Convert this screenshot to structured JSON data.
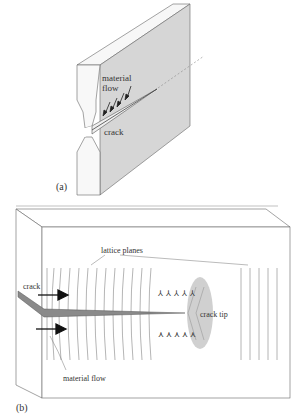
{
  "panel_a": {
    "label": "(a)",
    "annotations": {
      "material_flow_line1": "material",
      "material_flow_line2": "flow",
      "crack": "crack"
    }
  },
  "panel_b": {
    "label": "(b)",
    "annotations": {
      "lattice_planes": "lattice planes",
      "crack": "crack",
      "crack_tip": "crack tip",
      "material_flow": "material flow"
    }
  },
  "colors": {
    "face_shade": "#d9d9d9",
    "edge_light": "#f7f7f7",
    "crack_fill": "#8a8a8a",
    "tip_zone": "#cfcfcf",
    "line": "#555555"
  }
}
